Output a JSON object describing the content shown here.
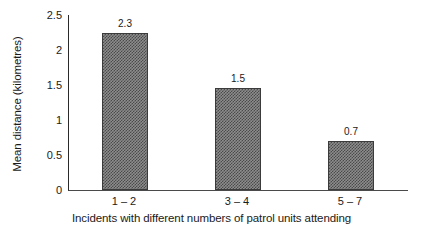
{
  "chart_data": {
    "type": "bar",
    "title": "",
    "xlabel": "Incidents with different numbers of patrol units attending",
    "ylabel": "Mean distance (kilometres)",
    "categories": [
      "1 – 2",
      "3 – 4",
      "5 – 7"
    ],
    "values": [
      2.3,
      1.5,
      0.7
    ],
    "bar_plotted_values": [
      2.24,
      1.46,
      0.7
    ],
    "data_labels": [
      "2.3",
      "1.5",
      "0.7"
    ],
    "ylim": [
      0,
      2.5
    ],
    "ytick_labels": [
      "0",
      "0.5",
      "1",
      "1.5",
      "2",
      "2.5"
    ],
    "ytick_values": [
      0,
      0.5,
      1,
      1.5,
      2,
      2.5
    ],
    "grid": false,
    "legend": false,
    "bar_fill_color": "#8d8d8d",
    "bar_pattern_color": "#4a4a4a",
    "bar_border_color": "#3b3b3b",
    "axis_color": "#2a2a2a",
    "background_color": "#ffffff"
  }
}
